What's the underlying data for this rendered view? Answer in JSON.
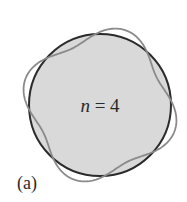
{
  "figure": {
    "panel_label": "(a)",
    "equation": {
      "variable": "n",
      "operator": " = ",
      "value": "4"
    },
    "circle": {
      "cx": 100,
      "cy": 105,
      "r": 71,
      "fill": "#d9d9d9",
      "stroke": "#2b2b2b"
    },
    "wave": {
      "n": 4,
      "amplitude": 8,
      "phase_deg": 15,
      "stroke": "#8a8a8a"
    }
  }
}
